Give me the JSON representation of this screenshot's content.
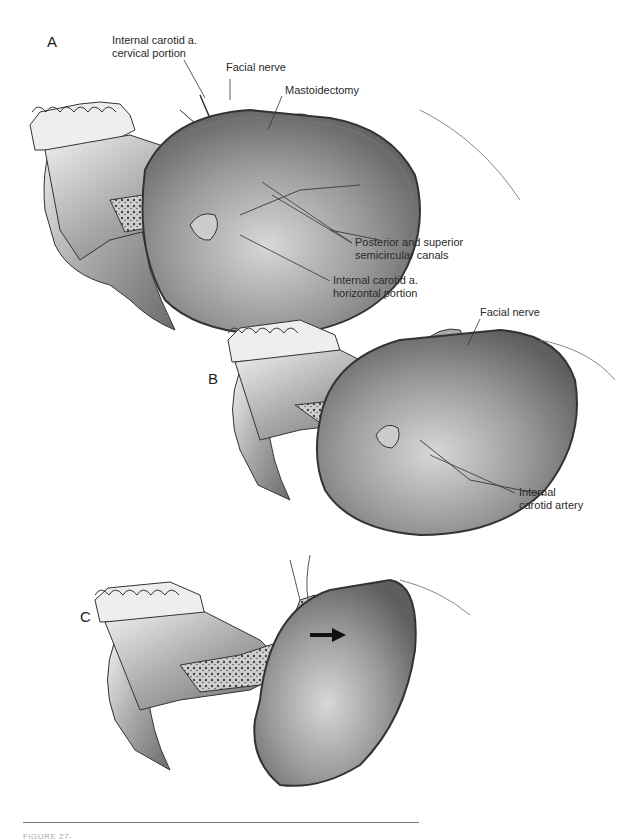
{
  "figure": {
    "panels": [
      {
        "letter": "A",
        "labels": {
          "ica_cervical": [
            "Internal carotid a.",
            "cervical portion"
          ],
          "facial_nerve": "Facial nerve",
          "mastoidectomy": "Mastoidectomy",
          "semicircular": [
            "Posterior and superior",
            "semicircular canals"
          ],
          "ica_horizontal": [
            "Internal carotid a.",
            "horizontal portion"
          ]
        }
      },
      {
        "letter": "B",
        "labels": {
          "facial_nerve": "Facial nerve",
          "ica": [
            "Internal",
            "carotid artery"
          ]
        }
      },
      {
        "letter": "C",
        "labels": {}
      }
    ],
    "caption": "FIGURE 27-"
  }
}
